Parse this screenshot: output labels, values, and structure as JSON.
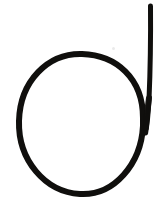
{
  "image": {
    "kind": "handwritten-glyph-scan",
    "width": 162,
    "height": 214,
    "background_color": "#ffffff",
    "ink_color": "#100f0d",
    "alt_text": "Hand-drawn lowercase letter d: a large open circle with a tall straight vertical stroke on its right side",
    "glyph_label": "d"
  },
  "strokes": [
    {
      "name": "circle-bowl",
      "shape": "ellipse",
      "center_x": 81,
      "center_y": 124,
      "radius_x": 62,
      "radius_y": 70,
      "stroke_width": 6,
      "color": "#100f0d",
      "description": "large closed loop forming the bowl of the letter"
    },
    {
      "name": "ascender-stem",
      "shape": "line",
      "x1": 151,
      "y1": 6,
      "x2": 146,
      "y2": 133,
      "stroke_width": 5,
      "color": "#100f0d",
      "description": "tall vertical ascender on the right, merging into the bowl"
    }
  ],
  "artifacts": [
    {
      "name": "scan-speck",
      "x": 112,
      "y": 47,
      "color": "#888888",
      "opacity": 0.18
    }
  ]
}
